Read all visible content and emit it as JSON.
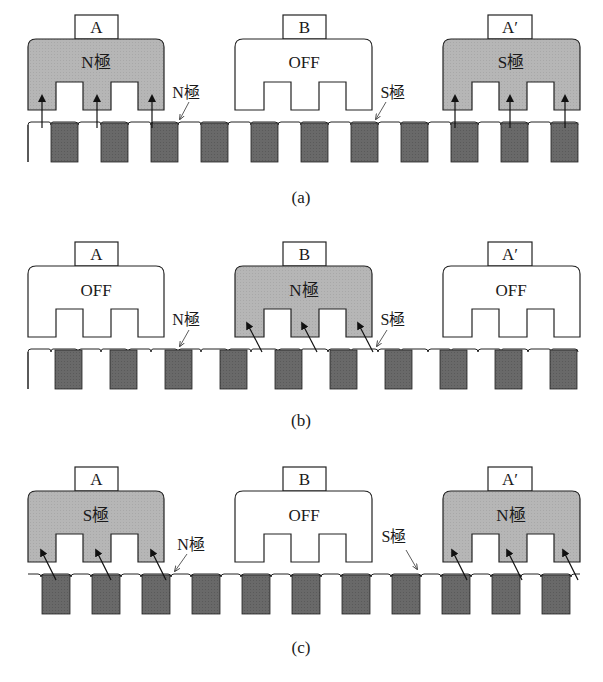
{
  "colors": {
    "energized_fill": "#b4b4b4",
    "off_fill": "#ffffff",
    "rotor_tooth_fill": "#666666",
    "stroke": "#222222",
    "background": "#ffffff"
  },
  "panels": [
    {
      "caption": "(a)",
      "stators": [
        {
          "tab_label": "A",
          "state_label": "N極",
          "energized": true
        },
        {
          "tab_label": "B",
          "state_label": "OFF",
          "energized": false
        },
        {
          "tab_label": "A′",
          "state_label": "S極",
          "energized": true
        }
      ],
      "annotations": [
        {
          "label": "N極"
        },
        {
          "label": "S極"
        }
      ],
      "arrow_direction": "up"
    },
    {
      "caption": "(b)",
      "stators": [
        {
          "tab_label": "A",
          "state_label": "OFF",
          "energized": false
        },
        {
          "tab_label": "B",
          "state_label": "N極",
          "energized": true
        },
        {
          "tab_label": "A′",
          "state_label": "OFF",
          "energized": false
        }
      ],
      "annotations": [
        {
          "label": "N極"
        },
        {
          "label": "S極"
        }
      ],
      "arrow_direction": "diagonal-up-left"
    },
    {
      "caption": "(c)",
      "stators": [
        {
          "tab_label": "A",
          "state_label": "S極",
          "energized": true
        },
        {
          "tab_label": "B",
          "state_label": "OFF",
          "energized": false
        },
        {
          "tab_label": "A′",
          "state_label": "N極",
          "energized": true
        }
      ],
      "annotations": [
        {
          "label": "N極"
        },
        {
          "label": "S極"
        }
      ],
      "arrow_direction": "diagonal-up-left"
    }
  ]
}
